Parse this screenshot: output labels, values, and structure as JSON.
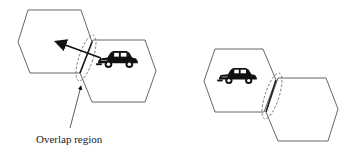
{
  "diagram": {
    "type": "cellular handoff illustration",
    "panels": [
      {
        "id": "left",
        "description": "Car moving from one hexagonal cell into the overlap region toward neighboring cell",
        "cells": 2,
        "vehicle": "car-icon",
        "motion_arrow": true
      },
      {
        "id": "right",
        "description": "Car inside a hexagonal cell adjacent to another cell, with overlap region marked",
        "cells": 2,
        "vehicle": "car-icon",
        "motion_arrow": false
      }
    ],
    "annotation": {
      "label": "Overlap region"
    }
  }
}
